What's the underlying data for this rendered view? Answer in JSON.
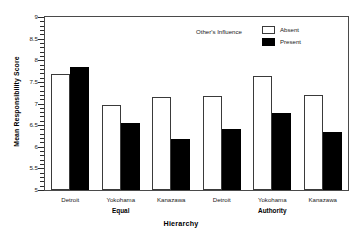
{
  "chart_data": {
    "type": "bar",
    "title": "",
    "xlabel": "Hierarchy",
    "ylabel": "Mean Responsibility Score",
    "ylim": [
      5,
      9
    ],
    "ytick_step": 0.5,
    "yticks": [
      "9",
      "8.5",
      "8",
      "7.5",
      "7",
      "6.5",
      "6",
      "5.5",
      "5"
    ],
    "grid": false,
    "legend_title": "Other's Influence",
    "legend_position": "top-right-inside",
    "groups": [
      {
        "label": "Equal",
        "categories": [
          "Detroit",
          "Yokohama",
          "Kanazawa"
        ]
      },
      {
        "label": "Authority",
        "categories": [
          "Detroit",
          "Yokohama",
          "Kanazawa"
        ]
      }
    ],
    "categories": [
      "Detroit",
      "Yokohama",
      "Kanazawa",
      "Detroit",
      "Yokohama",
      "Kanazawa"
    ],
    "series": [
      {
        "name": "Absent",
        "fill": "#ffffff",
        "values": [
          7.68,
          6.97,
          7.15,
          7.18,
          7.64,
          7.19
        ]
      },
      {
        "name": "Present",
        "fill": "#000000",
        "values": [
          7.85,
          6.55,
          6.18,
          6.42,
          6.78,
          6.35
        ]
      }
    ]
  },
  "colors": {
    "absent_fill": "#ffffff",
    "present_fill": "#000000",
    "axis": "#2b2b2b",
    "frame": "#4a4a4a",
    "text": "#000000",
    "background": "#ffffff"
  }
}
